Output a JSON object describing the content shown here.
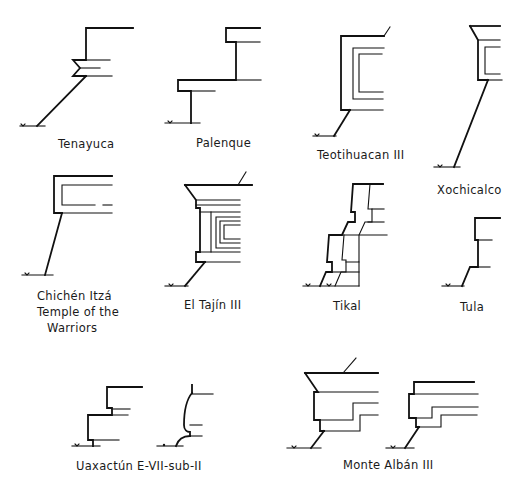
{
  "diagram": {
    "line_color": "#111111",
    "background": "#ffffff",
    "profiles": [
      {
        "id": "tenayuca",
        "label": "Tenayuca"
      },
      {
        "id": "palenque",
        "label": "Palenque"
      },
      {
        "id": "teotihuacan",
        "label": "Teotihuacan III"
      },
      {
        "id": "xochicalco",
        "label": "Xochicalco"
      },
      {
        "id": "chichen",
        "label_line1": "Chichén Itzá",
        "label_line2": "Temple of the",
        "label_line3": "Warriors"
      },
      {
        "id": "tajin",
        "label": "El Tajín III"
      },
      {
        "id": "tikal",
        "label": "Tikal"
      },
      {
        "id": "tula",
        "label": "Tula"
      },
      {
        "id": "uaxactun",
        "label": "Uaxactún E-VII-sub-II"
      },
      {
        "id": "montealban",
        "label": "Monte Albán III"
      }
    ]
  }
}
